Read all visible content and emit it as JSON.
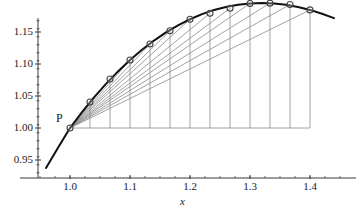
{
  "figure": {
    "point_label": "P",
    "x_axis_name": "x",
    "y_axis_name": ""
  },
  "chart_data": {
    "type": "line",
    "title": "",
    "subtitle": "",
    "xlabel": "x",
    "ylabel": "",
    "xlim": [
      0.955,
      1.445
    ],
    "ylim": [
      0.928,
      1.188
    ],
    "grid": false,
    "legend": null,
    "xticks": [
      1.0,
      1.1,
      1.2,
      1.3,
      1.4
    ],
    "xticklabels": [
      "1.0",
      "1.1",
      "1.2",
      "1.3",
      "1.4"
    ],
    "yticks": [
      0.95,
      1.0,
      1.05,
      1.1,
      1.15
    ],
    "yticklabels": [
      "0.95",
      "1.00",
      "1.05",
      "1.10",
      "1.15"
    ],
    "x_minor_tick_step": 0.025,
    "y_minor_tick_step": 0.0125,
    "annotations": [
      {
        "text": "P",
        "x": 1.0,
        "y": 1.0,
        "dx": -14,
        "dy": -10
      }
    ],
    "series": [
      {
        "name": "curve",
        "type": "line",
        "color": "#111111",
        "width": 2.0,
        "x": [
          0.96,
          0.98,
          1.0,
          1.02,
          1.04,
          1.06,
          1.08,
          1.1,
          1.12,
          1.14,
          1.16,
          1.18,
          1.2,
          1.22,
          1.24,
          1.26,
          1.28,
          1.3,
          1.32,
          1.34,
          1.36,
          1.38,
          1.4,
          1.42,
          1.44
        ],
        "y": [
          0.9375,
          0.969,
          1.0,
          1.0248,
          1.0478,
          1.069,
          1.0884,
          1.1062,
          1.1222,
          1.1366,
          1.1493,
          1.1604,
          1.1699,
          1.1779,
          1.1843,
          1.1892,
          1.1927,
          1.1947,
          1.1953,
          1.1946,
          1.1925,
          1.1891,
          1.1845,
          1.1786,
          1.1716
        ]
      },
      {
        "name": "secant-endpoints",
        "type": "scatter",
        "marker": "open-circle",
        "color": "#444444",
        "size": 5.0,
        "x": [
          1.0,
          1.0333,
          1.0667,
          1.1,
          1.1333,
          1.1667,
          1.2,
          1.2333,
          1.2667,
          1.3,
          1.3333,
          1.3667,
          1.4
        ],
        "y": [
          1.0,
          1.0406,
          1.0766,
          1.1062,
          1.1312,
          1.152,
          1.1699,
          1.1792,
          1.1871,
          1.1947,
          1.1951,
          1.193,
          1.1845
        ]
      }
    ],
    "secant_lines": {
      "from": {
        "x": 1.0,
        "y": 1.0
      },
      "color": "#8a8a8a",
      "width": 0.8,
      "to_x": [
        1.0333,
        1.0667,
        1.1,
        1.1333,
        1.1667,
        1.2,
        1.2333,
        1.2667,
        1.3,
        1.3333,
        1.3667,
        1.4
      ],
      "to_y": [
        1.0406,
        1.0766,
        1.1062,
        1.1312,
        1.152,
        1.1699,
        1.1792,
        1.1871,
        1.1947,
        1.1951,
        1.193,
        1.1845
      ]
    },
    "drop_lines": {
      "color": "#8a8a8a",
      "width": 0.8,
      "baseline_y": 1.0,
      "x": [
        1.0333,
        1.0667,
        1.1,
        1.1333,
        1.1667,
        1.2,
        1.2333,
        1.2667,
        1.3,
        1.3333,
        1.3667,
        1.4
      ]
    },
    "baseline": {
      "color": "#8a8a8a",
      "width": 0.8,
      "y": 1.0,
      "x_from": 1.0,
      "x_to": 1.4
    },
    "colors": {
      "curve": "#111111",
      "secant": "#8a8a8a",
      "axis": "#3a3a3a",
      "marker_edge": "#444444",
      "background": "#ffffff"
    }
  }
}
